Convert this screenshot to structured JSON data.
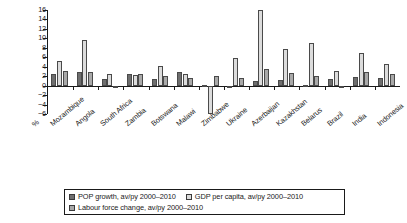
{
  "chart_data": {
    "type": "bar",
    "title": "",
    "xlabel": "",
    "ylabel": "%",
    "ylim": [
      -6,
      16
    ],
    "yticks": [
      16,
      14,
      12,
      10,
      8,
      6,
      4,
      2,
      0,
      -2,
      -4,
      -6
    ],
    "ytick_labels": [
      "16",
      "14",
      "12",
      "10",
      "8",
      "6",
      "4",
      "2",
      "0",
      "−2",
      "−4",
      "−6"
    ],
    "grid": false,
    "legend_position": "bottom",
    "categories": [
      "Mozambique",
      "Angola",
      "South Africa",
      "Zambia",
      "Botswana",
      "Malawi",
      "Zimbabwe",
      "Ukraine",
      "Azerbaijan",
      "Kazakhstan",
      "Belarus",
      "Brazil",
      "India",
      "Indonesia"
    ],
    "series": [
      {
        "name": "POP growth, av/py 2000–2010",
        "color": "#6e6e6e",
        "values": [
          2.4,
          2.9,
          1.3,
          2.4,
          1.5,
          2.9,
          0.1,
          -0.5,
          1.0,
          1.2,
          0.2,
          1.4,
          1.9,
          1.7
        ]
      },
      {
        "name": "GDP per capita, av/py 2000–2010",
        "color": "#dcdcdc",
        "values": [
          5.2,
          9.7,
          2.5,
          2.3,
          4.2,
          2.5,
          -5.9,
          5.9,
          16.1,
          7.7,
          9.1,
          3.0,
          7.0,
          4.5
        ]
      },
      {
        "name": "Labour force change, av/py 2000–2010",
        "color": "#a9a9a9",
        "values": [
          3.1,
          2.8,
          -0.2,
          2.5,
          2.1,
          1.6,
          2.0,
          1.6,
          3.6,
          2.7,
          2.1,
          0.0,
          2.8,
          2.4
        ]
      }
    ]
  },
  "axis": {
    "percent_label": "%"
  }
}
